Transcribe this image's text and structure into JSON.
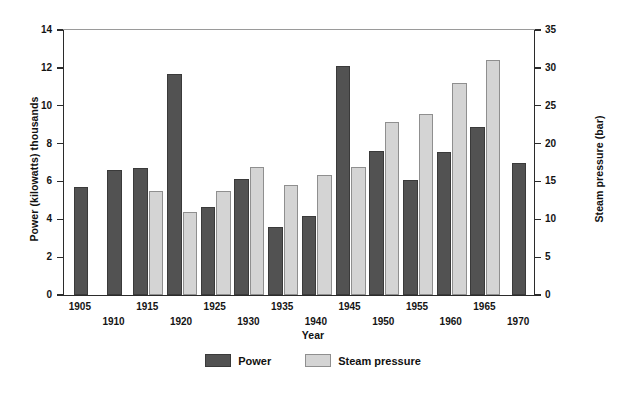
{
  "chart_data": {
    "type": "bar",
    "title": "",
    "xlabel": "Year",
    "ylabel": "Power (kilowatts) thousands",
    "ylabel_right": "Steam pressure (bar)",
    "categories": [
      "1905",
      "1910",
      "1915",
      "1920",
      "1925",
      "1930",
      "1935",
      "1940",
      "1945",
      "1950",
      "1955",
      "1960",
      "1965",
      "1970"
    ],
    "series": [
      {
        "name": "Power",
        "axis": "left",
        "unit": "thousands of kilowatts",
        "color": "#525252",
        "values": [
          5.7,
          6.6,
          6.7,
          11.7,
          4.65,
          6.15,
          3.6,
          4.2,
          12.1,
          7.6,
          6.1,
          7.55,
          8.85,
          7.0
        ]
      },
      {
        "name": "Steam pressure",
        "axis": "right",
        "unit": "bar",
        "color": "#d4d4d4",
        "values": [
          null,
          null,
          13.8,
          10.9,
          13.8,
          16.9,
          14.5,
          15.9,
          16.9,
          22.8,
          23.9,
          28.0,
          31.0,
          null
        ]
      }
    ],
    "ylim": [
      0,
      14
    ],
    "yticks": [
      "0",
      "2",
      "4",
      "6",
      "8",
      "10",
      "12",
      "14"
    ],
    "ylim_right": [
      0,
      35
    ],
    "yticks_right": [
      "0",
      "5",
      "10",
      "15",
      "20",
      "25",
      "30",
      "35"
    ],
    "grid": false,
    "legend_position": "bottom-center"
  },
  "legend": {
    "entries": [
      {
        "label": "Power",
        "color": "#525252"
      },
      {
        "label": "Steam pressure",
        "color": "#d4d4d4"
      }
    ]
  }
}
